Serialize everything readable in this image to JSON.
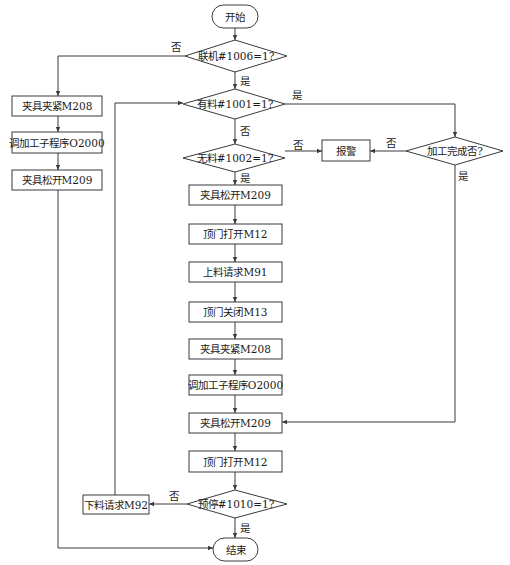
{
  "diagram": {
    "type": "flowchart",
    "nodes": {
      "start": {
        "label": "开始",
        "shape": "terminal"
      },
      "d_online": {
        "label": "联机#1006=1?",
        "shape": "decision"
      },
      "d_has_material": {
        "label": "有料#1001=1?",
        "shape": "decision"
      },
      "d_no_material": {
        "label": "无料#1002=1?",
        "shape": "decision"
      },
      "alarm": {
        "label": "报警",
        "shape": "process"
      },
      "d_done": {
        "label": "加工完成否?",
        "shape": "decision"
      },
      "l_clamp": {
        "label": "夹具夹紧M208",
        "shape": "process"
      },
      "l_call": {
        "label": "调加工子程序O2000",
        "shape": "process"
      },
      "l_release": {
        "label": "夹具松开M209",
        "shape": "process"
      },
      "m1": {
        "label": "夹具松开M209",
        "shape": "process"
      },
      "m2": {
        "label": "顶门打开M12",
        "shape": "process"
      },
      "m3": {
        "label": "上料请求M91",
        "shape": "process"
      },
      "m4": {
        "label": "顶门关闭M13",
        "shape": "process"
      },
      "m5": {
        "label": "夹具夹紧M208",
        "shape": "process"
      },
      "m6": {
        "label": "调加工子程序O2000",
        "shape": "process"
      },
      "m7": {
        "label": "夹具松开M209",
        "shape": "process"
      },
      "m8": {
        "label": "顶门打开M12",
        "shape": "process"
      },
      "d_prestop": {
        "label": "预停#1010=1?",
        "shape": "decision"
      },
      "unload": {
        "label": "下料请求M92",
        "shape": "process"
      },
      "end": {
        "label": "结束",
        "shape": "terminal"
      }
    },
    "edge_labels": {
      "online_no": "否",
      "online_yes": "是",
      "has_yes": "是",
      "has_no": "否",
      "nomat_no": "否",
      "nomat_yes": "是",
      "done_no": "否",
      "done_yes": "是",
      "prestop_no": "否",
      "prestop_yes": "是"
    },
    "edges": [
      {
        "from": "start",
        "to": "d_online"
      },
      {
        "from": "d_online",
        "to": "l_clamp",
        "label": "否"
      },
      {
        "from": "l_clamp",
        "to": "l_call"
      },
      {
        "from": "l_call",
        "to": "l_release"
      },
      {
        "from": "l_release",
        "to": "end"
      },
      {
        "from": "d_online",
        "to": "d_has_material",
        "label": "是"
      },
      {
        "from": "d_has_material",
        "to": "d_done",
        "label": "是"
      },
      {
        "from": "d_has_material",
        "to": "d_no_material",
        "label": "否"
      },
      {
        "from": "d_no_material",
        "to": "alarm",
        "label": "否"
      },
      {
        "from": "d_done",
        "to": "alarm",
        "label": "否"
      },
      {
        "from": "d_done",
        "to": "m7",
        "label": "是"
      },
      {
        "from": "d_no_material",
        "to": "m1",
        "label": "是"
      },
      {
        "from": "m1",
        "to": "m2"
      },
      {
        "from": "m2",
        "to": "m3"
      },
      {
        "from": "m3",
        "to": "m4"
      },
      {
        "from": "m4",
        "to": "m5"
      },
      {
        "from": "m5",
        "to": "m6"
      },
      {
        "from": "m6",
        "to": "m7"
      },
      {
        "from": "m7",
        "to": "m8"
      },
      {
        "from": "m8",
        "to": "d_prestop"
      },
      {
        "from": "d_prestop",
        "to": "unload",
        "label": "否"
      },
      {
        "from": "unload",
        "to": "d_has_material"
      },
      {
        "from": "d_prestop",
        "to": "end",
        "label": "是"
      }
    ]
  }
}
